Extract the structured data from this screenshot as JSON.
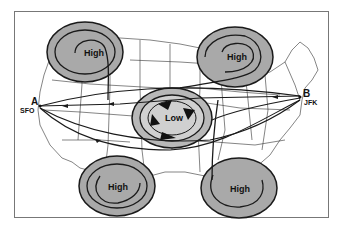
{
  "diagram": {
    "systems": [
      {
        "id": "high-nw",
        "type": "High",
        "label": "High",
        "cx": 85,
        "cy": 52
      },
      {
        "id": "high-ne",
        "type": "High",
        "label": "High",
        "cx": 235,
        "cy": 57
      },
      {
        "id": "low-center",
        "type": "Low",
        "label": "Low",
        "cx": 172,
        "cy": 118
      },
      {
        "id": "high-sw",
        "type": "High",
        "label": "High",
        "cx": 117,
        "cy": 185
      },
      {
        "id": "high-se",
        "type": "High",
        "label": "High",
        "cx": 239,
        "cy": 188
      }
    ],
    "points": [
      {
        "id": "A",
        "letter": "A",
        "code": "SFO"
      },
      {
        "id": "B",
        "letter": "B",
        "code": "JFK"
      }
    ],
    "colors": {
      "high_fill": "#a9a9a9",
      "low_outer": "#b8b8b8",
      "low_inner": "#d0d0d0",
      "line": "#1a1a1a",
      "frame": "#777777"
    }
  }
}
